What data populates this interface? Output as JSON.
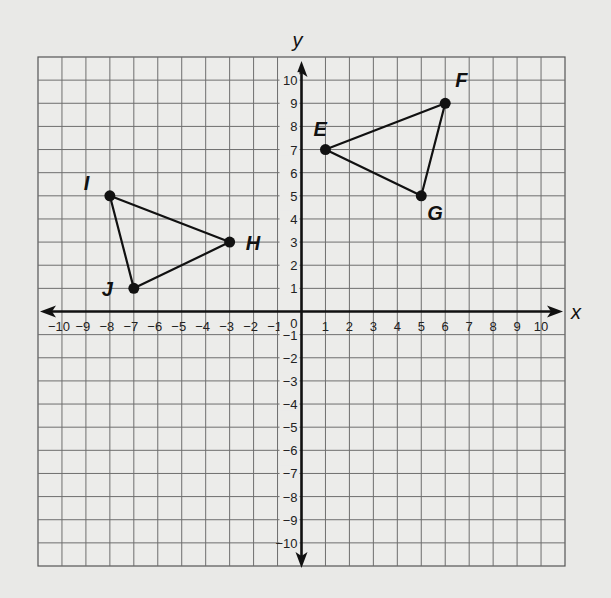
{
  "chart_data": {
    "type": "scatter",
    "title": "",
    "xlabel": "x",
    "ylabel": "y",
    "xlim": [
      -11,
      11
    ],
    "ylim": [
      -11,
      11
    ],
    "grid": true,
    "x_ticks": [
      -10,
      -9,
      -8,
      -7,
      -6,
      -5,
      -4,
      -3,
      -2,
      -1,
      1,
      2,
      3,
      4,
      5,
      6,
      7,
      8,
      9,
      10
    ],
    "y_ticks": [
      10,
      9,
      8,
      7,
      6,
      5,
      4,
      3,
      2,
      1,
      -1,
      -2,
      -3,
      -4,
      -5,
      -6,
      -7,
      -8,
      -9,
      -10
    ],
    "origin_label": "0",
    "points": [
      {
        "label": "E",
        "x": 1,
        "y": 7
      },
      {
        "label": "F",
        "x": 6,
        "y": 9
      },
      {
        "label": "G",
        "x": 5,
        "y": 5
      },
      {
        "label": "H",
        "x": -3,
        "y": 3
      },
      {
        "label": "I",
        "x": -8,
        "y": 5
      },
      {
        "label": "J",
        "x": -7,
        "y": 1
      }
    ],
    "series": [
      {
        "name": "Triangle EFG",
        "vertices": [
          "E",
          "F",
          "G"
        ]
      },
      {
        "name": "Triangle HIJ",
        "vertices": [
          "H",
          "I",
          "J"
        ]
      }
    ]
  }
}
